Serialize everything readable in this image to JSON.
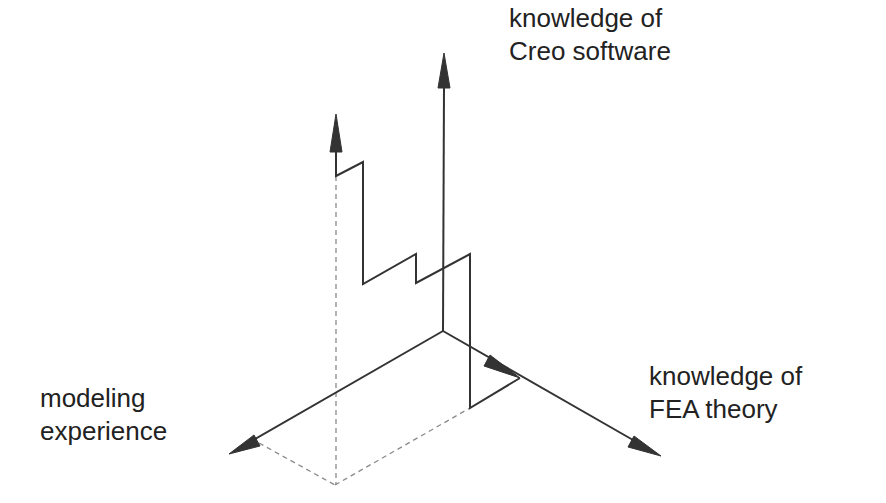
{
  "diagram": {
    "title": "",
    "colors": {
      "line": "#333333",
      "dashed": "#8a8a8a",
      "text": "#222222",
      "background": "#ffffff"
    },
    "axes": [
      {
        "id": "creo",
        "label_lines": [
          "knowledge of",
          "Creo software"
        ],
        "direction": "up"
      },
      {
        "id": "fea",
        "label_lines": [
          "knowledge of",
          "FEA theory"
        ],
        "direction": "down-right"
      },
      {
        "id": "modeling",
        "label_lines": [
          "modeling",
          "experience"
        ],
        "direction": "down-left"
      }
    ],
    "geometry": {
      "origin": [
        443,
        331
      ],
      "creo_axis_tip": [
        444,
        53
      ],
      "fea_axis_tip": [
        661,
        456
      ],
      "fea_inner_arrow_tip": [
        520,
        378
      ],
      "modeling_axis_tip": [
        229,
        454
      ],
      "staircase_path": [
        [
          336,
          114
        ],
        [
          336,
          176
        ],
        [
          363,
          162
        ],
        [
          363,
          284
        ],
        [
          416,
          254
        ],
        [
          416,
          283
        ],
        [
          470,
          254
        ],
        [
          470,
          408
        ],
        [
          520,
          378
        ]
      ],
      "dashed_lines": [
        [
          [
            336,
            176
          ],
          [
            336,
            485
          ]
        ],
        [
          [
            259,
            443
          ],
          [
            335,
            485
          ]
        ],
        [
          [
            335,
            485
          ],
          [
            470,
            408
          ]
        ]
      ]
    }
  },
  "labels": {
    "creo_line1": "knowledge of",
    "creo_line2": "Creo software",
    "fea_line1": "knowledge of",
    "fea_line2": "FEA theory",
    "modeling_line1": "modeling",
    "modeling_line2": "experience"
  }
}
